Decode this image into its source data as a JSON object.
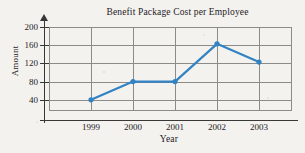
{
  "chart_data": {
    "type": "line",
    "title": "Benefit Package Cost per Employee",
    "xlabel": "Year",
    "ylabel": "Amount",
    "categories": [
      "1999",
      "2000",
      "2001",
      "2002",
      "2003"
    ],
    "values": [
      40,
      80,
      80,
      163,
      123
    ],
    "series": [
      {
        "name": "Benefit Package Cost per Employee",
        "values": [
          40,
          80,
          80,
          163,
          123
        ]
      }
    ],
    "y_ticks": [
      40,
      80,
      120,
      160,
      200
    ],
    "x_ticks": [
      "1999",
      "2000",
      "2001",
      "2002",
      "2003"
    ],
    "ylim": [
      0,
      220
    ],
    "grid": true,
    "legend": "none",
    "line_color": "#3183c4",
    "marker": "circle",
    "marker_color": "#3183c4",
    "grid_color": "#8d8b88",
    "axis_color": "#3a3836",
    "background_color": "#f4f2ee",
    "text_color": "#23211f"
  },
  "y_axis": {
    "label": "Amount",
    "ticks": [
      {
        "value": 200,
        "label": "200"
      },
      {
        "value": 160,
        "label": "160"
      },
      {
        "value": 120,
        "label": "120"
      },
      {
        "value": 80,
        "label": "80"
      },
      {
        "value": 40,
        "label": "40"
      }
    ]
  },
  "x_axis": {
    "label": "Year",
    "ticks": [
      {
        "label": "1999"
      },
      {
        "label": "2000"
      },
      {
        "label": "2001"
      },
      {
        "label": "2002"
      },
      {
        "label": "2003"
      }
    ]
  }
}
